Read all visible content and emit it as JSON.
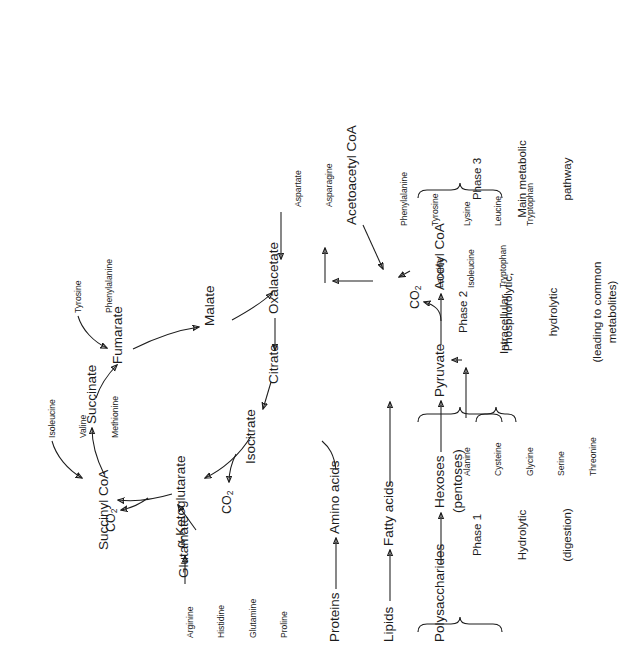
{
  "figure": {
    "orientation": "rotated-90-ccw",
    "ink_color": "#1c1c1c",
    "background": "#ffffff"
  },
  "nodes": {
    "polysaccharides": "Polysaccharides",
    "hexoses": "Hexoses",
    "pentoses": "(pentoses)",
    "lipids": "Lipids",
    "fatty_acids": "Fatty acids",
    "proteins": "Proteins",
    "amino_acids": "Amino acids",
    "pyruvate": "Pyruvate",
    "acetyl_coa": "Acetyl CoA",
    "acetoacetyl_coa": "Acetoacetyl CoA",
    "citrate": "Citrate",
    "isocitrate": "Isocitrate",
    "alpha_ketoglutarate": "α-Ketoglutarate",
    "succinyl_coa": "Succinyl CoA",
    "succinate": "Succinate",
    "fumarate": "Fumarate",
    "malate": "Malate",
    "oxalacetate": "Oxalacetate",
    "glutamate": "Glutamate"
  },
  "byproducts": {
    "co2_pyruvate": "CO",
    "co2_pyruvate_sub": "2",
    "co2_isocitrate": "CO",
    "co2_isocitrate_sub": "2",
    "co2_ketoglutarate": "CO",
    "co2_ketoglutarate_sub": "2"
  },
  "amino_acid_groups": {
    "to_pyruvate": [
      "Alanine",
      "Cysteine",
      "Glycine",
      "Serine",
      "Threonine"
    ],
    "to_acetyl_coa": [
      "Leucine",
      "Isoleucine",
      "Tryptophan"
    ],
    "to_acetoacetyl_coa": [
      "Phenylalanine",
      "Tyrosine",
      "Lysine",
      "Leucine",
      "Tryptophan"
    ],
    "to_glutamate": [
      "Arginine",
      "Histidine",
      "Glutamine",
      "Proline"
    ],
    "to_succinyl_coa": [
      "Isoleucine",
      "Valine",
      "Methionine"
    ],
    "to_fumarate": [
      "Tyrosine",
      "Phenylalanine"
    ],
    "to_oxalacetate": [
      "Aspartate",
      "Asparagine"
    ]
  },
  "phases": [
    {
      "id": "phase-1",
      "title": "Phase 1",
      "line2": "Hydrolytic",
      "line3": "(digestion)",
      "line4": ""
    },
    {
      "id": "phase-2",
      "title": "Phase 2",
      "line2": "Phosphorolytic,",
      "line3": "hydrolytic",
      "line4": "(leading to common\nmetabolites)"
    },
    {
      "id": "phase-3",
      "title": "Phase 3",
      "line2": "Main metabolic",
      "line3": "pathway",
      "line4": ""
    }
  ],
  "compartment": {
    "label": "Intracellular"
  }
}
